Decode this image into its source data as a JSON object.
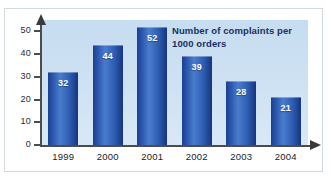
{
  "chart_data": {
    "type": "bar",
    "title": "Number of complaints per 1000 orders",
    "title_lines": [
      "Number of complaints per",
      "1000 orders"
    ],
    "categories": [
      "1999",
      "2000",
      "2001",
      "2002",
      "2003",
      "2004"
    ],
    "values": [
      32,
      44,
      52,
      39,
      28,
      21
    ],
    "xlabel": "",
    "ylabel": "",
    "ylim": [
      0,
      55
    ],
    "yticks": [
      0,
      10,
      20,
      30,
      40,
      50
    ],
    "ytick_labels": [
      "0",
      "10",
      "20",
      "30",
      "40",
      "50"
    ],
    "grid": false,
    "legend": false,
    "legend_position": "none",
    "bar_color": "#2a56ad",
    "bar_color_dark": "#15357f",
    "bar_color_light": "#4a7ccd",
    "data_label_color": "#ffffff",
    "plot_background": "#cfe2f3",
    "frame_border_color": "#cfd8e3",
    "axis_color": "#4c4c4c",
    "title_color": "#17305e",
    "axis_arrows": {
      "y_axis_arrow": "arrow-up",
      "x_axis_arrow": "arrow-right"
    }
  }
}
